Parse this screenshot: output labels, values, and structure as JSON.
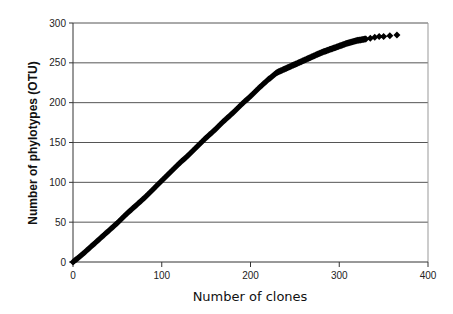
{
  "chart_data": {
    "type": "scatter",
    "title": "",
    "xlabel": "Number of clones",
    "ylabel": "Number of phylotypes (OTU)",
    "xlim": [
      0,
      400
    ],
    "ylim": [
      0,
      300
    ],
    "x_ticks": [
      0,
      100,
      200,
      300,
      400
    ],
    "y_ticks": [
      0,
      50,
      100,
      150,
      200,
      250,
      300
    ],
    "grid": "horizontal",
    "legend": null,
    "marker": "diamond",
    "color": "#000000",
    "series": [
      {
        "name": "Rarefaction curve",
        "x": [
          0,
          10,
          20,
          30,
          40,
          50,
          60,
          70,
          80,
          90,
          100,
          110,
          120,
          130,
          140,
          150,
          160,
          170,
          180,
          190,
          200,
          210,
          220,
          230,
          240,
          250,
          260,
          270,
          280,
          290,
          300,
          310,
          320,
          330,
          335,
          340,
          345,
          350,
          357,
          365
        ],
        "y": [
          0,
          9,
          19,
          29,
          39,
          49,
          60,
          70,
          80,
          91,
          102,
          113,
          124,
          134,
          145,
          156,
          166,
          177,
          187,
          198,
          208,
          219,
          229,
          238,
          243,
          248,
          253,
          258,
          263,
          267,
          271,
          275,
          278,
          280,
          281,
          282,
          283,
          283,
          284,
          285
        ]
      }
    ]
  }
}
